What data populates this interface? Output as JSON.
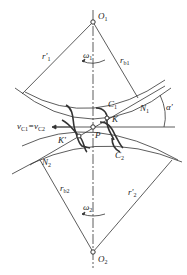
{
  "diagram": {
    "title": "",
    "labels": {
      "O1": "O",
      "O1_sub": "1",
      "O2": "O",
      "O2_sub": "2",
      "P": "P",
      "K": "K",
      "K_prime": "K'",
      "C1": "C",
      "C1_sub": "1",
      "C2": "C",
      "C2_sub": "2",
      "N1": "N",
      "N1_sub": "1",
      "N2": "N",
      "N2_sub": "2",
      "r1_prime": "r'",
      "r1_prime_sub": "1",
      "rb1": "r",
      "rb1_sub": "b1",
      "r2_prime": "r'",
      "r2_prime_sub": "2",
      "rb2": "r",
      "rb2_sub": "b2",
      "omega1": "ω",
      "omega1_sub": "1",
      "omega2": "ω",
      "omega2_sub": "2",
      "alpha_prime": "α'",
      "velocity": "v",
      "velocity_sub1": "C1",
      "velocity_eq": "=v",
      "velocity_sub2": "C2"
    },
    "colors": {
      "line": "#333333",
      "background": "#ffffff"
    }
  }
}
